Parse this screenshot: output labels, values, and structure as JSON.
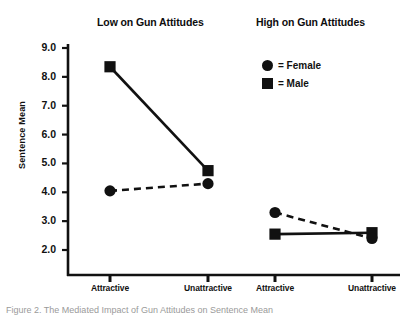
{
  "figure": {
    "y_axis_title": "Sentence Mean",
    "panel_titles": {
      "low": "Low on Gun Attitudes",
      "high": "High on Gun Attitudes"
    },
    "caption": "Figure 2. The Mediated Impact of Gun Attitudes on Sentence Mean"
  },
  "legend": {
    "position": "top-right",
    "entries": [
      {
        "marker": "circle-marker-icon",
        "label": "= Female"
      },
      {
        "marker": "square-marker-icon",
        "label": "= Male"
      }
    ]
  },
  "chart_data": {
    "type": "line",
    "title": "",
    "xlabel": "",
    "ylabel": "Sentence Mean",
    "ylim": [
      1.6,
      9.4
    ],
    "yticks": [
      "9.0",
      "8.0",
      "7.0",
      "6.0",
      "5.0",
      "4.0",
      "3.0",
      "2.0"
    ],
    "ytick_values": [
      9.0,
      8.0,
      7.0,
      6.0,
      5.0,
      4.0,
      3.0,
      2.0
    ],
    "grid": false,
    "panels": [
      {
        "name": "Low on Gun Attitudes",
        "categories": [
          "Attractive",
          "Unattractive"
        ],
        "series": [
          {
            "name": "Male",
            "marker": "square",
            "line": "solid",
            "values": [
              8.35,
              4.75
            ]
          },
          {
            "name": "Female",
            "marker": "circle",
            "line": "dashed",
            "values": [
              4.05,
              4.3
            ]
          }
        ]
      },
      {
        "name": "High on Gun Attitudes",
        "categories": [
          "Attractive",
          "Unattractive"
        ],
        "series": [
          {
            "name": "Male",
            "marker": "square",
            "line": "solid",
            "values": [
              2.55,
              2.6
            ]
          },
          {
            "name": "Female",
            "marker": "circle",
            "line": "dashed",
            "values": [
              3.3,
              2.4
            ]
          }
        ]
      }
    ],
    "xtick_labels": [
      "Attractive",
      "Unattractive",
      "Attractive",
      "Unattractive"
    ],
    "colors": {
      "ink": "#111111",
      "background": "#ffffff"
    }
  }
}
